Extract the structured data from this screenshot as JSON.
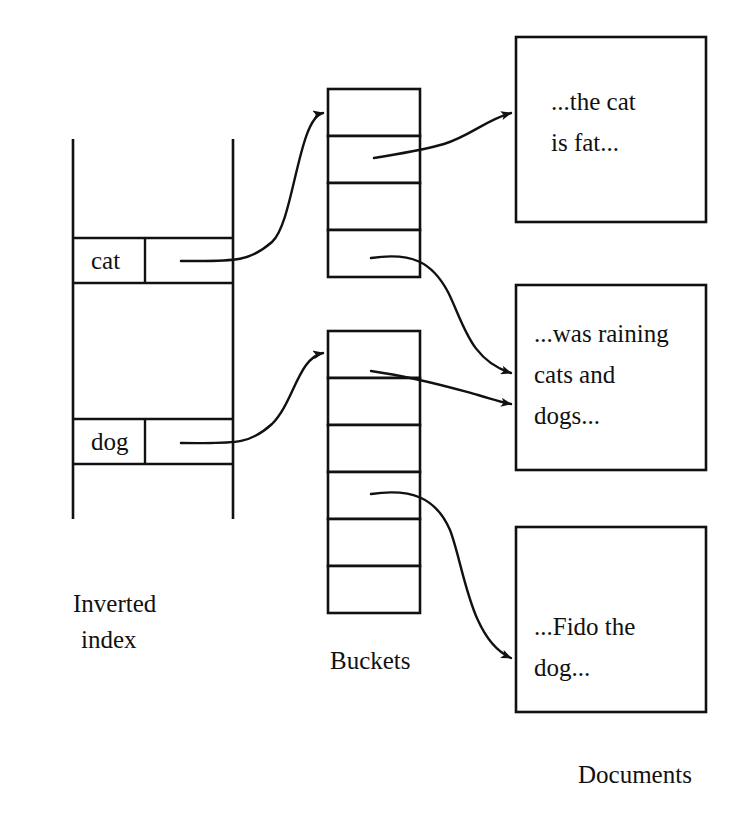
{
  "diagram": {
    "background_color": "#ffffff",
    "line_color": "#111111"
  },
  "inverted_index": {
    "caption_line1": "Inverted",
    "caption_line2": "index",
    "entries": [
      {
        "term": "cat",
        "pointer_label": ""
      },
      {
        "term": "dog",
        "pointer_label": ""
      }
    ]
  },
  "buckets": {
    "caption": "Buckets",
    "lists": [
      {
        "owner": "cat",
        "cell_count": 4,
        "cells": [
          "",
          "",
          "",
          ""
        ]
      },
      {
        "owner": "dog",
        "cell_count": 6,
        "cells": [
          "",
          "",
          "",
          "",
          "",
          ""
        ]
      }
    ]
  },
  "documents": {
    "caption": "Documents",
    "items": [
      {
        "lines": [
          "...the cat",
          "is fat..."
        ]
      },
      {
        "lines": [
          "...was raining",
          "cats and",
          "dogs..."
        ]
      },
      {
        "lines": [
          "...Fido the",
          "dog..."
        ]
      }
    ]
  },
  "arrows": [
    {
      "from": "index-entry-cat",
      "to": "bucket-cat"
    },
    {
      "from": "index-entry-dog",
      "to": "bucket-dog"
    },
    {
      "from": "bucket-cat-cell-2",
      "to": "document-1"
    },
    {
      "from": "bucket-cat-cell-4",
      "to": "document-2"
    },
    {
      "from": "bucket-dog-cell-2",
      "to": "document-2"
    },
    {
      "from": "bucket-dog-cell-4",
      "to": "document-3"
    }
  ]
}
